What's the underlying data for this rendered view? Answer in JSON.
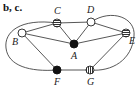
{
  "panel_label": "b, c.",
  "nodes": [
    {
      "id": "A",
      "label": "A",
      "fill": "black"
    },
    {
      "id": "B",
      "label": "B",
      "fill": "white"
    },
    {
      "id": "C",
      "label": "C",
      "fill": "horizontal-stripes"
    },
    {
      "id": "D",
      "label": "D",
      "fill": "white"
    },
    {
      "id": "E",
      "label": "E",
      "fill": "horizontal-stripes"
    },
    {
      "id": "F",
      "label": "F",
      "fill": "black"
    },
    {
      "id": "G",
      "label": "G",
      "fill": "vertical-stripes"
    }
  ],
  "edges": [
    [
      "C",
      "D"
    ],
    [
      "B",
      "C"
    ],
    [
      "C",
      "A"
    ],
    [
      "D",
      "A"
    ],
    [
      "D",
      "E"
    ],
    [
      "B",
      "A"
    ],
    [
      "A",
      "E"
    ],
    [
      "B",
      "F"
    ],
    [
      "F",
      "G"
    ],
    [
      "E",
      "G"
    ],
    [
      "C",
      "F"
    ],
    [
      "D",
      "G"
    ]
  ],
  "colors": {
    "line": "#444444",
    "black_node": "#111111",
    "white_node": "#ffffff"
  }
}
